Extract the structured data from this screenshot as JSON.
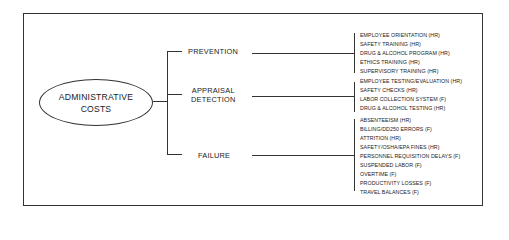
{
  "diagram": {
    "root": {
      "line1": "ADMINISTRATIVE",
      "line2": "COSTS"
    },
    "categories": [
      {
        "label_line1": "PREVENTION",
        "label_line2": "",
        "items": [
          "EMPLOYEE ORIENTATION (HR)",
          "SAFETY TRAINING (HR)",
          "DRUG & ALCOHOL PROGRAM (HR)",
          "ETHICS TRAINING (HR)",
          "SUPERVISORY TRAINING (HR)"
        ]
      },
      {
        "label_line1": "APPRAISAL",
        "label_line2": "DETECTION",
        "items": [
          "EMPLOYEE TESTING/EVALUATION (HR)",
          "SAFETY CHECKS (HR)",
          "LABOR COLLECTION SYSTEM (F)",
          "DRUG & ALCOHOL TESTING (HR)"
        ]
      },
      {
        "label_line1": "FAILURE",
        "label_line2": "",
        "items": [
          "ABSENTEEISM (HR)",
          "BILLING/DD250 ERRORS (F)",
          "ATTRITION (HR)",
          "SAFETY/OSHA/EPA FINES (HR)",
          "PERSONNEL REQUISITION DELAYS (F)",
          "SUSPENDED LABOR (F)",
          "OVERTIME (F)",
          "PRODUCTIVITY LOSSES (F)",
          "TRAVEL BALANCES (F)"
        ]
      }
    ]
  }
}
